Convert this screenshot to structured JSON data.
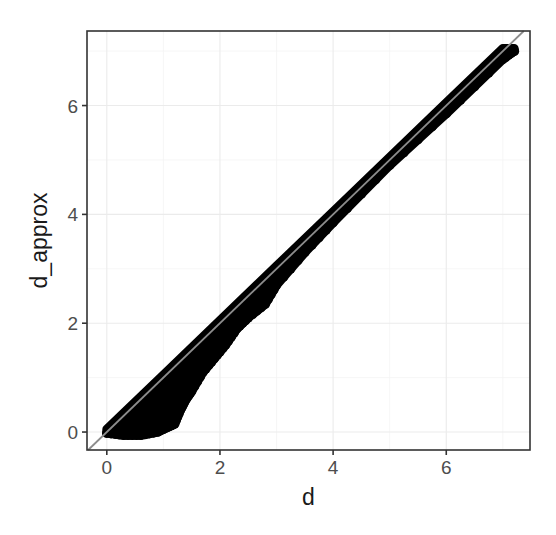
{
  "chart_data": {
    "type": "scatter",
    "title": "",
    "xlabel": "d",
    "ylabel": "d_approx",
    "xlim": [
      -0.35,
      7.48
    ],
    "ylim": [
      -0.33,
      7.37
    ],
    "x_ticks": [
      0,
      2,
      4,
      6
    ],
    "y_ticks": [
      0,
      2,
      4,
      6
    ],
    "x_tick_labels": [
      "0",
      "2",
      "4",
      "6"
    ],
    "y_tick_labels": [
      "0",
      "2",
      "4",
      "6"
    ],
    "grid": true,
    "legend": null,
    "reference_line": {
      "type": "identity",
      "slope": 1,
      "intercept": 0,
      "color": "#8c8c8c"
    },
    "point_color": "#000000",
    "upper_envelope": {
      "x": [
        0.0,
        1.0,
        2.0,
        3.0,
        4.0,
        5.0,
        6.0,
        7.0,
        7.2
      ],
      "y": [
        0.05,
        1.05,
        2.05,
        3.05,
        4.05,
        5.05,
        6.05,
        7.05,
        7.05
      ]
    },
    "lower_envelope": {
      "x": [
        0.0,
        0.3,
        0.6,
        0.9,
        1.1,
        1.2,
        1.3,
        1.4,
        1.5,
        1.7,
        1.9,
        2.1,
        2.3,
        2.5,
        2.8,
        3.0,
        3.5,
        4.0,
        5.0,
        6.0,
        7.0,
        7.2
      ],
      "y": [
        -0.02,
        -0.06,
        -0.06,
        0.0,
        0.1,
        0.15,
        0.4,
        0.6,
        0.75,
        1.1,
        1.35,
        1.6,
        1.9,
        2.1,
        2.35,
        2.7,
        3.3,
        3.85,
        4.9,
        5.85,
        6.85,
        7.0
      ]
    }
  }
}
